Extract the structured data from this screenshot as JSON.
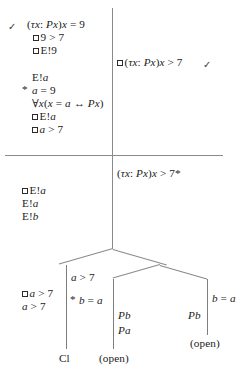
{
  "figure": {
    "type": "semantic-tableau-tree",
    "divider": {
      "vertical": true,
      "horizontal": true
    }
  },
  "quadrants": {
    "top_left": {
      "checkmark": "✓",
      "lines": [
        {
          "id": "tl1",
          "text": "(τx: Px)x = 9",
          "box": false,
          "check": true
        },
        {
          "id": "tl2",
          "text": "9 > 7",
          "box": true
        },
        {
          "id": "tl3",
          "text": "E!9",
          "box": true
        }
      ],
      "block2": [
        {
          "id": "tl4",
          "text": "E!a",
          "box": false
        },
        {
          "id": "tl5",
          "text": "a = 9",
          "box": false,
          "star": "*"
        },
        {
          "id": "tl6",
          "text": "∀x(x = a ↔ Px)",
          "box": false
        },
        {
          "id": "tl7",
          "text": "E!a",
          "box": true
        },
        {
          "id": "tl8",
          "text": "a > 7",
          "box": true
        }
      ]
    },
    "top_right": {
      "lines": [
        {
          "id": "tr1",
          "text": "(τx: Px)x > 7",
          "box": true,
          "check": true,
          "checkmark": "✓"
        }
      ]
    },
    "bottom_left": {
      "lines": [
        {
          "id": "bl1",
          "text": "E!a",
          "box": true
        },
        {
          "id": "bl2",
          "text": "E!a",
          "box": false
        },
        {
          "id": "bl3",
          "text": "E!b",
          "box": false
        }
      ]
    },
    "bottom_right": {
      "lines": [
        {
          "id": "br1",
          "text": "(τx: Px)x > 7*",
          "box": false
        }
      ]
    }
  },
  "tree": {
    "left_branch": {
      "outer_labels": [
        {
          "id": "lb1",
          "text": "a > 7",
          "box": true
        },
        {
          "id": "lb2",
          "text": "a > 7",
          "box": false
        }
      ],
      "inner_labels": [
        {
          "id": "lb3",
          "text": "a > 7",
          "box": false
        },
        {
          "id": "lb4",
          "text": "b = a",
          "box": false,
          "star": "*"
        }
      ],
      "terminal": "Cl"
    },
    "middle_branch": {
      "labels": [
        {
          "id": "mb1",
          "text": "Pb",
          "box": false
        },
        {
          "id": "mb2",
          "text": "Pa",
          "box": false
        }
      ],
      "terminal": "(open)"
    },
    "right_branch": {
      "labels": [
        {
          "id": "rb1",
          "text": "Pb",
          "box": false
        },
        {
          "id": "rb2",
          "text": "b = a",
          "box": false
        }
      ],
      "terminal": "(open)"
    }
  },
  "colors": {
    "ink": "#1b1b1b",
    "rule": "#8a8a8a",
    "paper": "#ffffff"
  }
}
